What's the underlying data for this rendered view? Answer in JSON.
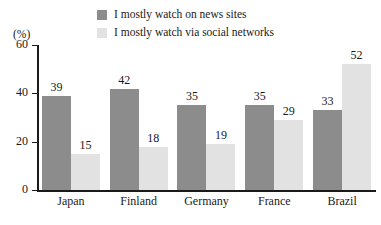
{
  "chart_data": {
    "type": "bar",
    "title": "",
    "subtitle": "",
    "xlabel": "",
    "ylabel": "",
    "unit_label": "(%)",
    "categories": [
      "Japan",
      "Finland",
      "Germany",
      "France",
      "Brazil"
    ],
    "series": [
      {
        "name": "I mostly watch on news sites",
        "color": "#8c8c8c",
        "values": [
          39,
          42,
          35,
          35,
          33
        ]
      },
      {
        "name": "I mostly watch via social networks",
        "color": "#e2e2e2",
        "values": [
          15,
          18,
          19,
          29,
          52
        ]
      }
    ],
    "ylim": [
      0,
      60
    ],
    "yticks": [
      0,
      20,
      40,
      60
    ],
    "ytick_labels": [
      "0",
      "20",
      "40",
      "60"
    ],
    "grid": false,
    "legend_position": "top-center",
    "data_labels": true,
    "axis_color": "#1a1a1a",
    "background": "#ffffff"
  }
}
